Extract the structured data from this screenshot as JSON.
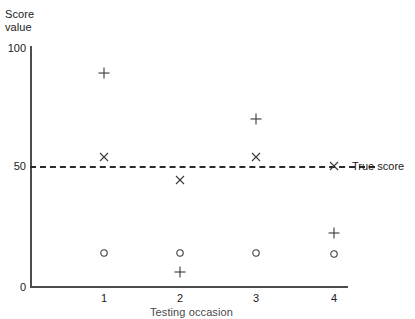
{
  "chart_data": {
    "type": "scatter",
    "title": "",
    "ylabel": "Score\nvalue",
    "xlabel": "Testing occasion",
    "ylim": [
      0,
      100
    ],
    "yticks": [
      0,
      50,
      100
    ],
    "ytick_labels": [
      "0",
      "50",
      "100"
    ],
    "xlim": [
      0.5,
      4.5
    ],
    "xticks": [
      1,
      2,
      3,
      4
    ],
    "xtick_labels": [
      "1",
      "2",
      "3",
      "4"
    ],
    "grid": false,
    "legend_position": "right-inline",
    "reference_line": {
      "label": "True score",
      "value": 50,
      "style": "dashed",
      "color": "#2b2b2b",
      "marker": "x"
    },
    "series": [
      {
        "name": "plus",
        "marker": "+",
        "x": [
          1,
          2,
          3,
          4
        ],
        "values": [
          89,
          6,
          70,
          23
        ]
      },
      {
        "name": "cross",
        "marker": "x",
        "x": [
          1,
          2,
          3,
          4
        ],
        "values": [
          54,
          45,
          54,
          50
        ]
      },
      {
        "name": "circle",
        "marker": "o",
        "x": [
          1,
          2,
          3,
          4
        ],
        "values": [
          14,
          14,
          14,
          14
        ]
      }
    ],
    "points": [
      {
        "series": "plus",
        "marker": "+",
        "x": 1,
        "y": 89,
        "px": 104,
        "py": 73
      },
      {
        "series": "cross",
        "marker": "x",
        "x": 1,
        "y": 54,
        "px": 104,
        "py": 157
      },
      {
        "series": "circle",
        "marker": "o",
        "x": 1,
        "y": 14,
        "px": 104,
        "py": 253
      },
      {
        "series": "cross",
        "marker": "x",
        "x": 2,
        "y": 45,
        "px": 180,
        "py": 180
      },
      {
        "series": "circle",
        "marker": "o",
        "x": 2,
        "y": 14,
        "px": 180,
        "py": 253
      },
      {
        "series": "plus",
        "marker": "+",
        "x": 2,
        "y": 6,
        "px": 180,
        "py": 272
      },
      {
        "series": "plus",
        "marker": "+",
        "x": 3,
        "y": 70,
        "px": 256,
        "py": 119
      },
      {
        "series": "cross",
        "marker": "x",
        "x": 3,
        "y": 54,
        "px": 256,
        "py": 157
      },
      {
        "series": "circle",
        "marker": "o",
        "x": 3,
        "y": 14,
        "px": 256,
        "py": 253
      },
      {
        "series": "cross",
        "marker": "x",
        "x": 4,
        "y": 50,
        "px": 334,
        "py": 166
      },
      {
        "series": "plus",
        "marker": "+",
        "x": 4,
        "y": 23,
        "px": 334,
        "py": 233
      },
      {
        "series": "circle",
        "marker": "o",
        "x": 4,
        "y": 14,
        "px": 334,
        "py": 254
      }
    ],
    "colors": {
      "axis": "#4d4d4d",
      "marker": "#3a3a3a",
      "reference_line": "#2b2b2b",
      "text": "#1a1a1a",
      "background": "#ffffff"
    }
  },
  "ytick_positions": {
    "0": 282,
    "50": 161,
    "100": 43
  },
  "xtick_positions": {
    "1": 104,
    "2": 180,
    "3": 256,
    "4": 334
  }
}
